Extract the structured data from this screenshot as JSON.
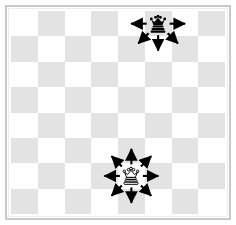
{
  "figure": {
    "board": {
      "files": 8,
      "ranks": 8,
      "light_color": "#ffffff",
      "dark_color": "#e3e3e3",
      "frame_color": "#c9c9c9",
      "top_left_square": "light"
    },
    "pieces": [
      {
        "id": "black-queen",
        "name": "black-queen",
        "symbol": "♛",
        "color": "black",
        "type": "queen",
        "col": 5,
        "row": 0,
        "square_shade": "dark"
      },
      {
        "id": "white-queen",
        "name": "white-queen",
        "symbol": "♕",
        "color": "white",
        "type": "queen",
        "col": 4,
        "row": 6,
        "square_shade": "light"
      }
    ],
    "arrows": [
      {
        "piece": "black-queen",
        "direction": "left",
        "name": "arrow-left"
      },
      {
        "piece": "black-queen",
        "direction": "right",
        "name": "arrow-right"
      },
      {
        "piece": "black-queen",
        "direction": "down",
        "name": "arrow-down"
      },
      {
        "piece": "black-queen",
        "direction": "down-left",
        "name": "arrow-down-left"
      },
      {
        "piece": "black-queen",
        "direction": "down-right",
        "name": "arrow-down-right"
      },
      {
        "piece": "white-queen",
        "direction": "up",
        "name": "arrow-up"
      },
      {
        "piece": "white-queen",
        "direction": "down",
        "name": "arrow-down"
      },
      {
        "piece": "white-queen",
        "direction": "left",
        "name": "arrow-left"
      },
      {
        "piece": "white-queen",
        "direction": "right",
        "name": "arrow-right"
      },
      {
        "piece": "white-queen",
        "direction": "up-left",
        "name": "arrow-up-left"
      },
      {
        "piece": "white-queen",
        "direction": "up-right",
        "name": "arrow-up-right"
      },
      {
        "piece": "white-queen",
        "direction": "down-left",
        "name": "arrow-down-left"
      },
      {
        "piece": "white-queen",
        "direction": "down-right",
        "name": "arrow-down-right"
      }
    ],
    "arrow_color": "#000000"
  }
}
